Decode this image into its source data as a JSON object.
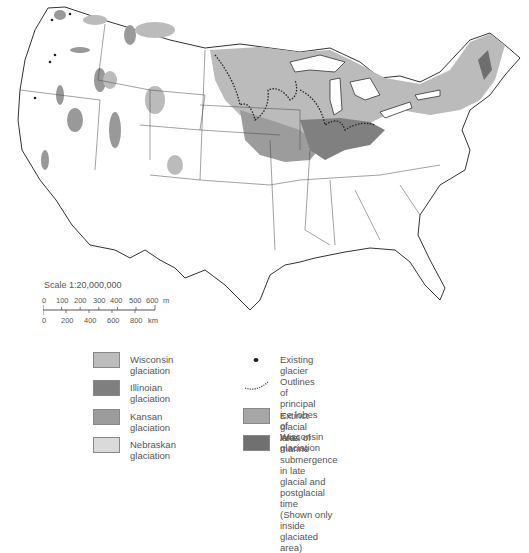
{
  "map": {
    "subject": "Glaciation of the conterminous United States",
    "colors": {
      "wisconsin": "#b9b9b9",
      "illinoian": "#7d7d7d",
      "kansan": "#9a9a9a",
      "nebraskan": "#d6d6d6",
      "extinct_lake": "#a4a4a4",
      "marine": "#6e6e6e",
      "outline": "#333333",
      "background": "#ffffff"
    }
  },
  "scale": {
    "title": "Scale 1:20,000,000",
    "miles_ticks": [
      "0",
      "100",
      "200",
      "300",
      "400",
      "500",
      "600"
    ],
    "miles_unit": "m",
    "km_ticks": [
      "0",
      "200",
      "400",
      "600",
      "800"
    ],
    "km_unit": "km"
  },
  "legend": {
    "left": [
      {
        "label": "Wisconsin glaciation",
        "color": "#bdbdbd"
      },
      {
        "label": "Illinoian glaciation",
        "color": "#7f7f7f"
      },
      {
        "label": "Kansan glaciation",
        "color": "#9c9c9c"
      },
      {
        "label": "Nebraskan glaciation",
        "color": "#dadada"
      }
    ],
    "right": [
      {
        "label": "Existing glacier",
        "symbol": "dot"
      },
      {
        "label": "Outlines of principal ice lobes\nof Wisconsin glaciation",
        "symbol": "hachured-line"
      },
      {
        "label": "Extinct glacial lake",
        "symbol": "swatch",
        "color": "#a6a6a6"
      },
      {
        "label": "Area of marine submergence in late\nglacial and postglacial time\n(Shown only inside glaciated area)",
        "symbol": "swatch",
        "color": "#707070"
      }
    ]
  }
}
